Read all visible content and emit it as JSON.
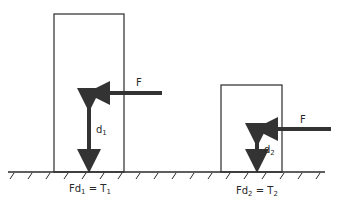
{
  "diagram": {
    "type": "physics-torque-comparison",
    "colors": {
      "stroke": "#2a2a2a",
      "arrow": "#333333",
      "background": "#ffffff"
    },
    "left": {
      "force_label": "F",
      "distance_label": "d",
      "distance_sub": "1",
      "equation": {
        "lhs": "Fd",
        "lhs_sub": "1",
        "op": "=",
        "rhs": "T",
        "rhs_sub": "1"
      }
    },
    "right": {
      "force_label": "F",
      "distance_label": "d",
      "distance_sub": "2",
      "equation": {
        "lhs": "Fd",
        "lhs_sub": "2",
        "op": "=",
        "rhs": "T",
        "rhs_sub": "2"
      }
    }
  }
}
